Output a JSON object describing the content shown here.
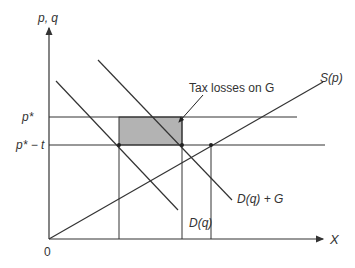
{
  "diagram": {
    "type": "economics-supply-demand",
    "axes": {
      "y_label": "p, q",
      "x_label": "X",
      "origin_label": "0"
    },
    "price_levels": [
      {
        "label": "p*",
        "name": "price-p-star"
      },
      {
        "label": "p* − t",
        "name": "price-p-star-minus-t"
      }
    ],
    "curves": [
      {
        "label": "S(p)",
        "name": "supply-curve"
      },
      {
        "label": "D(q)",
        "name": "demand-curve"
      },
      {
        "label": "D(q) + G",
        "name": "demand-plus-government-curve"
      }
    ],
    "annotation": {
      "label": "Tax losses on G"
    },
    "colors": {
      "line": "#333333",
      "shade": "#b3b3b3",
      "background": "#ffffff"
    }
  }
}
